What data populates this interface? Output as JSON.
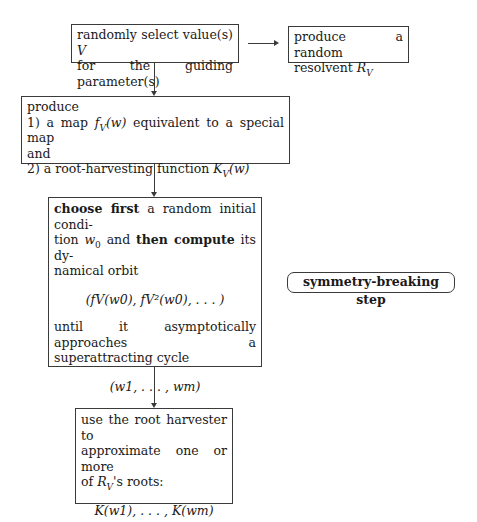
{
  "diagram": {
    "type": "flowchart",
    "boxes": {
      "select": {
        "line1": "randomly select value(s) ",
        "var": "V",
        "line2": "for the guiding parameter(s)"
      },
      "resolvent": {
        "line1": "produce a random",
        "line2": "resolvent ",
        "var": "R",
        "sub": "V"
      },
      "produce": {
        "line1": "produce",
        "item1_prefix": "1) a map ",
        "item1_fn": "f",
        "item1_sub": "V",
        "item1_arg": "(w)",
        "item1_suffix": " equivalent to a special map",
        "item1_cont": "and",
        "item2_prefix": "2) a root-harvesting function ",
        "item2_fn": "K",
        "item2_sub": "V",
        "item2_arg": "(w)"
      },
      "orbit": {
        "bold1": "choose first",
        "text1": " a random initial condi-",
        "text2a": "tion ",
        "w0": "w",
        "w0_sub": "0",
        "text2b": " and ",
        "bold2": "then compute",
        "text2c": " its dy-",
        "text3": "namical orbit",
        "formula1": "(fV(w0), fV²(w0), . . . )",
        "text4": "until it asymptotically approaches a",
        "text5": "superattracting cycle",
        "formula2": "(w1, . . . , wm)"
      },
      "harvest": {
        "line1": "use the root harvester to",
        "line2": "approximate one or more",
        "line3_prefix": "of ",
        "line3_var": "R",
        "line3_sub": "V",
        "line3_suffix": "'s roots:",
        "formula": "K(w1), . . . , K(wm)"
      }
    },
    "label": {
      "symmetry": "symmetry-breaking step"
    }
  }
}
